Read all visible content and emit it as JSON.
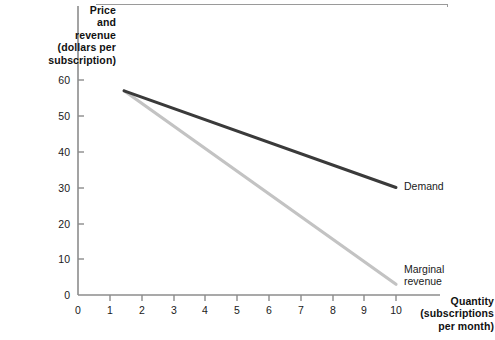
{
  "chart_data": {
    "type": "line",
    "title": "",
    "subtitle": "",
    "xlabel": "Quantity (subscriptions per month)",
    "ylabel": "Price and revenue (dollars per subscription)",
    "xlim": [
      0,
      10.6
    ],
    "ylim": [
      0,
      63
    ],
    "xticks": [
      0,
      1,
      2,
      3,
      4,
      5,
      6,
      7,
      8,
      9,
      10
    ],
    "yticks": [
      0,
      10,
      20,
      30,
      40,
      50,
      60
    ],
    "grid": false,
    "legend_position": "inline-right",
    "series": [
      {
        "name": "Demand",
        "color": "#3a3a3a",
        "points": [
          [
            1.45,
            57
          ],
          [
            10.0,
            30
          ]
        ]
      },
      {
        "name": "Marginal revenue",
        "color": "#c3c3c3",
        "points": [
          [
            1.45,
            57
          ],
          [
            10.0,
            3
          ]
        ]
      }
    ],
    "annotations": [
      {
        "text": "Demand",
        "x": 10.0,
        "y": 30
      },
      {
        "text": "Marginal revenue",
        "x": 10.0,
        "y": 3
      }
    ]
  },
  "axes": {
    "y_title": "Price\nand\nrevenue\n(dollars per\nsubscription)",
    "x_title": "Quantity\n(subscriptions\nper month)",
    "y_tick_labels": [
      "60",
      "50",
      "40",
      "30",
      "20",
      "10",
      "0"
    ],
    "x_tick_labels": [
      "0",
      "1",
      "2",
      "3",
      "4",
      "5",
      "6",
      "7",
      "8",
      "9",
      "10"
    ]
  },
  "labels": {
    "demand": "Demand",
    "marginal_revenue": "Marginal\nrevenue"
  },
  "colors": {
    "demand_line": "#3a3a3a",
    "marginal_revenue_line": "#c3c3c3",
    "axis": "#8c8c8c",
    "text": "#1a1a1a",
    "frame": "#9a9a9a",
    "background": "#ffffff"
  }
}
